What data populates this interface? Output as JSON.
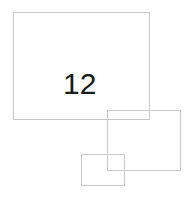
{
  "diagram": {
    "background": "#ffffff",
    "stroke_color": "#c8c8c8",
    "shapes": [
      {
        "id": "large-rect",
        "x": 13,
        "y": 12,
        "width": 137,
        "height": 108,
        "label": "12"
      },
      {
        "id": "medium-rect",
        "x": 107,
        "y": 110,
        "width": 74,
        "height": 61,
        "label": ""
      },
      {
        "id": "small-rect",
        "x": 81,
        "y": 154,
        "width": 44,
        "height": 32,
        "label": ""
      }
    ]
  }
}
